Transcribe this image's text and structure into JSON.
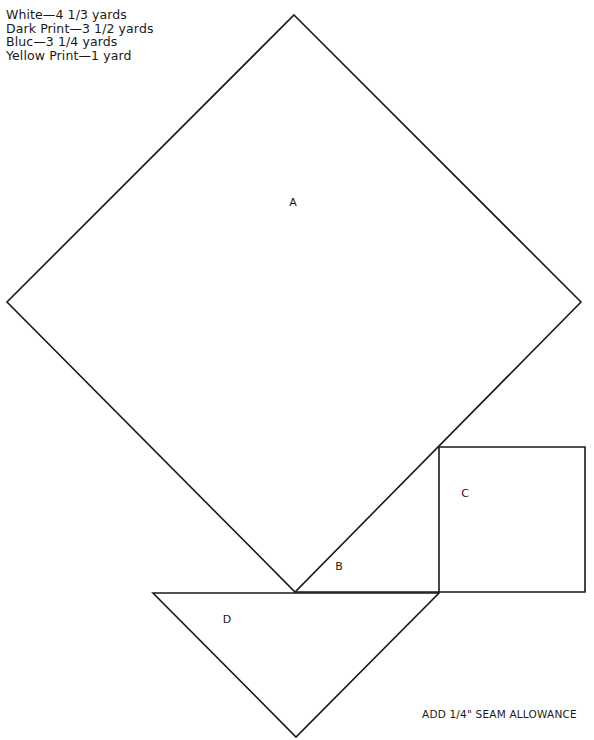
{
  "yardage": {
    "lines": [
      "White—4 1/3 yards",
      "Dark Print—3 1/2 yards",
      "Bluc—3 1/4 yards",
      "Yellow Print—1 yard"
    ]
  },
  "pieces": {
    "A": {
      "label": "A",
      "shape": "diamond",
      "points": [
        [
          294,
          15
        ],
        [
          581,
          302
        ],
        [
          295,
          592
        ],
        [
          7,
          302
        ]
      ],
      "label_pos": [
        293,
        202
      ]
    },
    "B": {
      "label": "B",
      "shape": "triangle",
      "points": [
        [
          295,
          592
        ],
        [
          439,
          592
        ],
        [
          439,
          447
        ]
      ],
      "label_pos": [
        339,
        566
      ]
    },
    "C": {
      "label": "C",
      "shape": "square",
      "points": [
        [
          439,
          447
        ],
        [
          585,
          447
        ],
        [
          585,
          592
        ],
        [
          439,
          592
        ]
      ],
      "label_pos": [
        465,
        493
      ]
    },
    "D": {
      "label": "D",
      "shape": "triangle",
      "points": [
        [
          153,
          593
        ],
        [
          439,
          593
        ],
        [
          296,
          737
        ]
      ],
      "label_pos": [
        227,
        619
      ]
    }
  },
  "note": {
    "seam_allowance": "ADD 1/4\" SEAM ALLOWANCE"
  },
  "colors": {
    "line": "#1a1a1a",
    "background": "#ffffff"
  }
}
